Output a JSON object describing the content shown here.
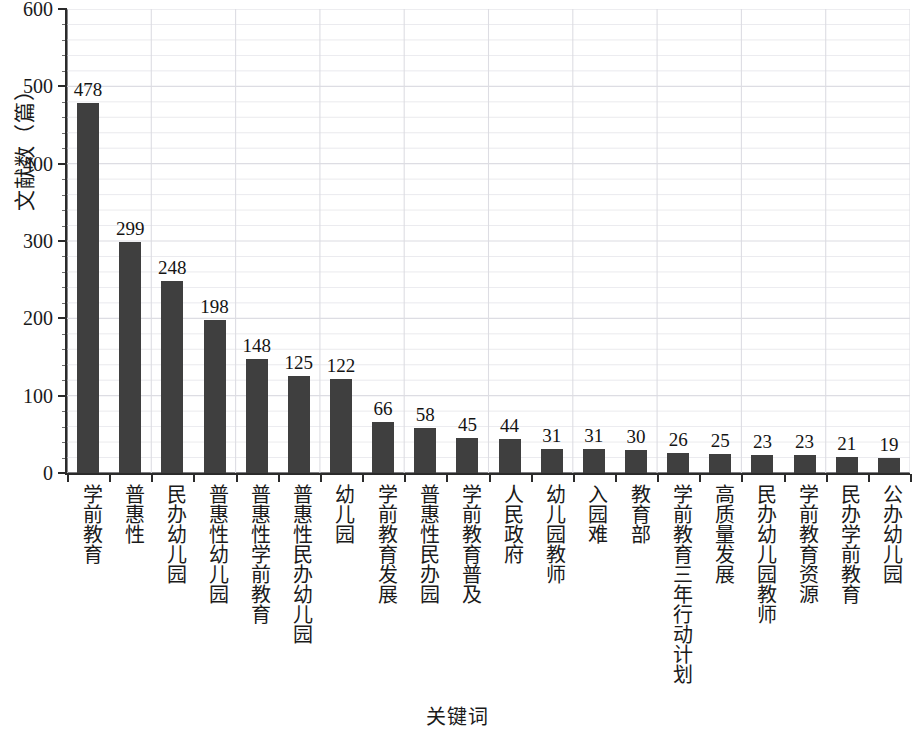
{
  "chart_data": {
    "type": "bar",
    "title": "",
    "xlabel": "关键词",
    "ylabel": "文献数（篇）",
    "ylim": [
      0,
      600
    ],
    "y_major_step": 100,
    "y_minor_step": 20,
    "grid": true,
    "legend": null,
    "bar_color": "#3f3f3f",
    "axis_color": "#2b2b2b",
    "grid_color": "#dcdce2",
    "y_tick_labels": [
      "0",
      "100",
      "200",
      "300",
      "400",
      "500",
      "600"
    ],
    "categories": [
      "学前教育",
      "普惠性",
      "民办幼儿园",
      "普惠性幼儿园",
      "普惠性学前教育",
      "普惠性民办幼儿园",
      "幼儿园",
      "学前教育发展",
      "普惠性民办园",
      "学前教育普及",
      "人民政府",
      "幼儿园教师",
      "入园难",
      "教育部",
      "学前教育三年行动计划",
      "高质量发展",
      "民办幼儿园教师",
      "学前教育资源",
      "民办学前教育",
      "公办幼儿园"
    ],
    "values": [
      478,
      299,
      248,
      198,
      148,
      125,
      122,
      66,
      58,
      45,
      44,
      31,
      31,
      30,
      26,
      25,
      23,
      23,
      21,
      19
    ],
    "value_labels": [
      "478",
      "299",
      "248",
      "198",
      "148",
      "125",
      "122",
      "66",
      "58",
      "45",
      "44",
      "31",
      "31",
      "30",
      "26",
      "25",
      "23",
      "23",
      "21",
      "19"
    ]
  }
}
